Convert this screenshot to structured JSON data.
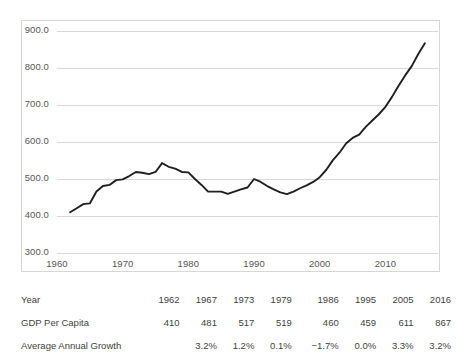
{
  "chart_data": {
    "type": "line",
    "title": "",
    "subtitle": "",
    "xlabel": "",
    "ylabel": "",
    "xlim": [
      1960,
      2018
    ],
    "ylim": [
      300.0,
      900.0
    ],
    "grid": true,
    "legend": "none",
    "line_color": "#1f1f1f",
    "ytick_labels": [
      "900.0",
      "800.0",
      "700.0",
      "600.0",
      "500.0",
      "400.0",
      "300.0"
    ],
    "ytick_values": [
      900.0,
      800.0,
      700.0,
      600.0,
      500.0,
      400.0,
      300.0
    ],
    "xtick_labels": [
      "1960",
      "1970",
      "1980",
      "1990",
      "2000",
      "2010"
    ],
    "xtick_values": [
      1960,
      1970,
      1980,
      1990,
      2000,
      2010
    ],
    "series": [
      {
        "name": "GDP Per Capita",
        "x": [
          1962,
          1963,
          1964,
          1965,
          1966,
          1967,
          1968,
          1969,
          1970,
          1971,
          1972,
          1973,
          1974,
          1975,
          1976,
          1977,
          1978,
          1979,
          1980,
          1981,
          1982,
          1983,
          1984,
          1985,
          1986,
          1987,
          1988,
          1989,
          1990,
          1991,
          1992,
          1993,
          1994,
          1995,
          1996,
          1997,
          1998,
          1999,
          2000,
          2001,
          2002,
          2003,
          2004,
          2005,
          2006,
          2007,
          2008,
          2009,
          2010,
          2011,
          2012,
          2013,
          2014,
          2015,
          2016
        ],
        "y": [
          410,
          421,
          432,
          434,
          466,
          481,
          484,
          497,
          499,
          508,
          519,
          517,
          513,
          519,
          543,
          533,
          528,
          519,
          518,
          500,
          484,
          466,
          466,
          466,
          460,
          466,
          472,
          477,
          500,
          492,
          481,
          472,
          464,
          459,
          466,
          475,
          483,
          492,
          505,
          525,
          551,
          571,
          596,
          611,
          620,
          641,
          658,
          675,
          695,
          722,
          752,
          780,
          805,
          838,
          867
        ]
      }
    ],
    "annotation_points": {
      "years": [
        1962,
        1967,
        1973,
        1979,
        1986,
        1995,
        2005,
        2016
      ],
      "gdp_per_capita": [
        410,
        481,
        517,
        519,
        460,
        459,
        611,
        867
      ]
    }
  },
  "table": {
    "rows": [
      {
        "label": "Year",
        "values": [
          "1962",
          "1967",
          "1973",
          "1979",
          "1986",
          "1995",
          "2005",
          "2016"
        ]
      },
      {
        "label": "GDP Per Capita",
        "values": [
          "410",
          "481",
          "517",
          "519",
          "460",
          "459",
          "611",
          "867"
        ]
      },
      {
        "label": "Average Annual Growth",
        "values": [
          "",
          "3.2%",
          "1.2%",
          "0.1%",
          "−1.7%",
          "0.0%",
          "3.3%",
          "3.2%"
        ]
      }
    ]
  }
}
